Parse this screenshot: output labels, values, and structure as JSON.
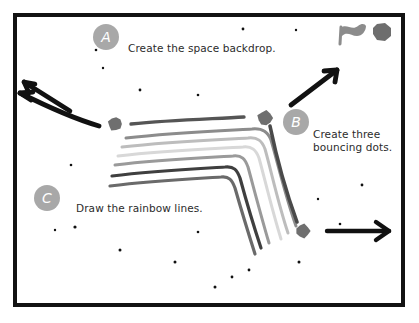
{
  "canvas": {
    "width": 419,
    "height": 323,
    "background": "#ffffff",
    "frame": {
      "name": "stage-frame",
      "x": 15,
      "y": 15,
      "width": 388,
      "height": 290,
      "stroke": "#121212",
      "stroke_width": 4
    }
  },
  "controls": [
    {
      "icon": "green-flag-icon",
      "label": "Green flag",
      "color": "#8c8c8c",
      "x": 348,
      "y": 24
    },
    {
      "icon": "stop-sign-icon",
      "label": "Stop",
      "color": "#6e6e6e",
      "x": 381,
      "y": 28
    }
  ],
  "steps": [
    {
      "letter": "A",
      "caption": "Create the space backdrop.",
      "badge_color": "#a8a8a8",
      "badge_x": 93,
      "badge_y": 24,
      "caption_x": 128,
      "caption_y": 42
    },
    {
      "letter": "B",
      "caption": "Create three\nbouncing dots.",
      "badge_color": "#a8a8a8",
      "badge_x": 283,
      "badge_y": 109,
      "caption_x": 313,
      "caption_y": 128
    },
    {
      "letter": "C",
      "caption": "Draw the rainbow lines.",
      "badge_color": "#a8a8a8",
      "badge_x": 34,
      "badge_y": 185,
      "caption_x": 76,
      "caption_y": 202
    }
  ],
  "arrows": [
    {
      "name": "arrow-up-left",
      "color": "#111111",
      "points": "66,110 22,83",
      "head": "up-left"
    },
    {
      "name": "arrow-left",
      "color": "#111111",
      "points": "96,125 19,92",
      "head": "left"
    },
    {
      "name": "arrow-up-right",
      "color": "#111111",
      "points": "290,104 337,69",
      "head": "up-right"
    },
    {
      "name": "arrow-right",
      "color": "#111111",
      "points": "327,231 389,231",
      "head": "right"
    }
  ],
  "dots": [
    {
      "name": "bouncing-dot-left",
      "x": 115,
      "y": 124,
      "r": 7,
      "color": "#6f6f6f"
    },
    {
      "name": "bouncing-dot-middle",
      "x": 265,
      "y": 118,
      "r": 7.5,
      "color": "#6f6f6f"
    },
    {
      "name": "bouncing-dot-right",
      "x": 303,
      "y": 231,
      "r": 7,
      "color": "#6f6f6f"
    }
  ],
  "rainbow_lines": [
    {
      "name": "rainbow-line-1",
      "color": "#555555",
      "width": 3.4,
      "path": "M 131 124 C 170 120 210 119 244 117"
    },
    {
      "name": "rainbow-line-2",
      "color": "#8c8c8c",
      "width": 3.0,
      "path": "M 126 138 C 168 133 214 131 252 129 C 263 128 268 132 271 140 C 277 160 285 195 296 226"
    },
    {
      "name": "rainbow-line-3",
      "color": "#bdbdbd",
      "width": 3.0,
      "path": "M 122 147 C 164 142 210 140 248 138 C 258 137 262 141 265 149 C 271 170 278 203 288 233"
    },
    {
      "name": "rainbow-line-4",
      "color": "#d8d8d8",
      "width": 3.0,
      "path": "M 118 156 C 160 151 206 149 243 147 C 252 146 256 150 259 158 C 265 180 272 210 281 239"
    },
    {
      "name": "rainbow-line-5",
      "color": "#9a9a9a",
      "width": 3.0,
      "path": "M 115 165 C 155 160 198 158 233 156 C 242 155 245 159 248 167 C 254 189 261 216 269 243"
    },
    {
      "name": "rainbow-line-6",
      "color": "#3f3f3f",
      "width": 3.2,
      "path": "M 112 176 C 152 171 192 169 225 167 C 234 166 237 170 240 178 C 246 200 253 224 261 248"
    },
    {
      "name": "rainbow-line-7",
      "color": "#6a6a6a",
      "width": 3.2,
      "path": "M 110 186 C 150 181 189 179 221 177 C 229 176 232 180 235 188 C 241 209 248 232 255 254"
    },
    {
      "name": "rainbow-line-descender",
      "color": "#4a4a4a",
      "width": 3.6,
      "path": "M 270 126 C 276 155 286 192 297 222"
    }
  ],
  "stars": [
    {
      "x": 96,
      "y": 50,
      "r": 1.3
    },
    {
      "x": 103,
      "y": 68,
      "r": 1.2
    },
    {
      "x": 140,
      "y": 90,
      "r": 1.4
    },
    {
      "x": 198,
      "y": 95,
      "r": 1.3
    },
    {
      "x": 243,
      "y": 29,
      "r": 1.4
    },
    {
      "x": 296,
      "y": 30,
      "r": 1.2
    },
    {
      "x": 71,
      "y": 165,
      "r": 1.3
    },
    {
      "x": 55,
      "y": 230,
      "r": 1.2
    },
    {
      "x": 75,
      "y": 227,
      "r": 1.6
    },
    {
      "x": 120,
      "y": 250,
      "r": 1.5
    },
    {
      "x": 175,
      "y": 262,
      "r": 1.5
    },
    {
      "x": 198,
      "y": 232,
      "r": 1.3
    },
    {
      "x": 215,
      "y": 287,
      "r": 1.5
    },
    {
      "x": 232,
      "y": 277,
      "r": 1.4
    },
    {
      "x": 249,
      "y": 270,
      "r": 1.4
    },
    {
      "x": 299,
      "y": 262,
      "r": 1.5
    },
    {
      "x": 340,
      "y": 224,
      "r": 1.3
    },
    {
      "x": 362,
      "y": 185,
      "r": 1.4
    },
    {
      "x": 318,
      "y": 199,
      "r": 1.2
    }
  ]
}
